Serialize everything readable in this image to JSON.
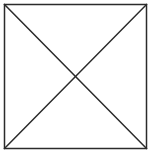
{
  "canvas": {
    "width": 153,
    "height": 155,
    "background_color": "#ffffff"
  },
  "figure": {
    "name": "crossed-box",
    "caption": "",
    "stroke_color": "#2b2b2b",
    "stroke_width": 1.5,
    "fill_color": "#ffffff",
    "square": {
      "x": 4.5,
      "y": 4.5,
      "width": 142,
      "height": 144
    },
    "center": {
      "x": 75.5,
      "y": 76.5
    },
    "diagonals": [
      {
        "name": "diagonal-top-left-to-bottom-right",
        "x1": 4.5,
        "y1": 4.5,
        "x2": 146.5,
        "y2": 148.5
      },
      {
        "name": "diagonal-top-right-to-bottom-left",
        "x1": 146.5,
        "y1": 4.5,
        "x2": 4.5,
        "y2": 148.5
      }
    ],
    "edges": [
      {
        "name": "edge-top",
        "x1": 4.5,
        "y1": 4.5,
        "x2": 146.5,
        "y2": 4.5
      },
      {
        "name": "edge-right",
        "x1": 146.5,
        "y1": 4.5,
        "x2": 146.5,
        "y2": 148.5
      },
      {
        "name": "edge-bottom",
        "x1": 146.5,
        "y1": 148.5,
        "x2": 4.5,
        "y2": 148.5
      },
      {
        "name": "edge-left",
        "x1": 4.5,
        "y1": 148.5,
        "x2": 4.5,
        "y2": 4.5
      }
    ]
  }
}
